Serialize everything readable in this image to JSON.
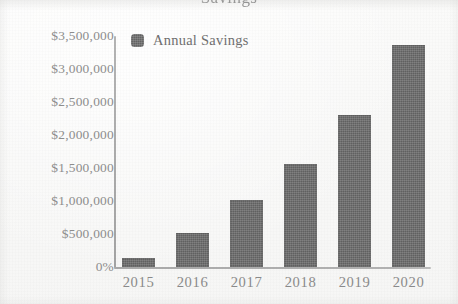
{
  "title_partial": "Savings",
  "legend": {
    "swatch_color": "#6a6a6a",
    "label": "Annual Savings"
  },
  "axis": {
    "y_ticks": [
      "$3,500,000",
      "$3,000,000",
      "$2,500,000",
      "$2,000,000",
      "$1,500,000",
      "$1,000,000",
      "$500,000",
      "0%"
    ],
    "x_ticks": [
      "2015",
      "2016",
      "2017",
      "2018",
      "2019",
      "2020"
    ]
  },
  "chart_data": {
    "type": "bar",
    "title": "Savings",
    "xlabel": "",
    "ylabel": "",
    "categories": [
      "2015",
      "2016",
      "2017",
      "2018",
      "2019",
      "2020"
    ],
    "values": [
      140000,
      520000,
      1010000,
      1560000,
      2310000,
      3360000
    ],
    "value_labels": [
      "$140,000",
      "$520,000",
      "$1,010,000",
      "$1,560,000",
      "$2,310,000",
      "$3,360,000"
    ],
    "series": [
      {
        "name": "Annual Savings",
        "color": "#6a6a6a",
        "values": [
          140000,
          520000,
          1010000,
          1560000,
          2310000,
          3360000
        ]
      }
    ],
    "ylim": [
      0,
      3500000
    ],
    "ytick_values": [
      3500000,
      3000000,
      2500000,
      2000000,
      1500000,
      1000000,
      500000,
      0
    ],
    "ytick_labels": [
      "$3,500,000",
      "$3,000,000",
      "$2,500,000",
      "$2,000,000",
      "$1,500,000",
      "$1,000,000",
      "$500,000",
      "0%"
    ],
    "grid": false,
    "legend_position": "top-left",
    "orientation": "vertical"
  },
  "colors": {
    "bar": "#6a6a6a",
    "axis": "#aaaaaa",
    "tick_text": "#8b8b8b",
    "background": "#fbfbfa"
  }
}
